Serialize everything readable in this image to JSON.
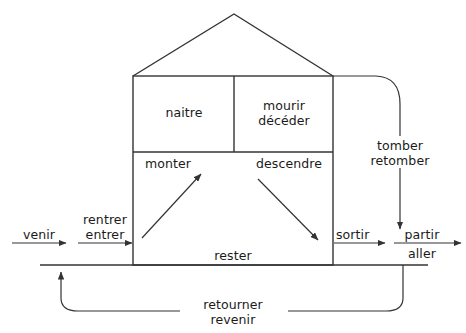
{
  "diagram": {
    "type": "house-diagram",
    "rooms": {
      "upper_left": {
        "labels": [
          "naitre"
        ]
      },
      "upper_right": {
        "labels": [
          "mourir",
          "décéder"
        ]
      },
      "lower_left": {
        "labels": [
          "monter"
        ]
      },
      "lower_right": {
        "labels": [
          "descendre"
        ]
      },
      "ground_floor": {
        "labels": [
          "rester"
        ]
      }
    },
    "arrows": [
      {
        "name": "venir",
        "labels": [
          "venir"
        ],
        "direction": "right"
      },
      {
        "name": "rentrer-entrer",
        "labels": [
          "rentrer",
          "entrer"
        ],
        "direction": "right"
      },
      {
        "name": "monter",
        "labels": [
          "monter"
        ],
        "direction": "up-right"
      },
      {
        "name": "descendre",
        "labels": [
          "descendre"
        ],
        "direction": "down-right"
      },
      {
        "name": "sortir",
        "labels": [
          "sortir"
        ],
        "direction": "right"
      },
      {
        "name": "partir-aller",
        "labels": [
          "partir",
          "aller"
        ],
        "direction": "right"
      },
      {
        "name": "tomber-retomber",
        "labels": [
          "tomber",
          "retomber"
        ],
        "direction": "down"
      },
      {
        "name": "retourner-revenir",
        "labels": [
          "retourner",
          "revenir"
        ],
        "direction": "up-left"
      }
    ],
    "labels": {
      "naitre": "naitre",
      "mourir": "mourir",
      "deceder": "décéder",
      "monter": "monter",
      "descendre": "descendre",
      "rester": "rester",
      "venir": "venir",
      "rentrer": "rentrer",
      "entrer": "entrer",
      "sortir": "sortir",
      "partir": "partir",
      "aller": "aller",
      "tomber": "tomber",
      "retomber": "retomber",
      "retourner": "retourner",
      "revenir": "revenir"
    },
    "colors": {
      "stroke": "#333333",
      "text": "#1a1a1a",
      "background": "#ffffff"
    }
  }
}
